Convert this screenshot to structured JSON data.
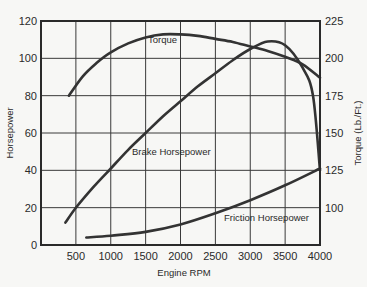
{
  "chart_data": {
    "type": "line",
    "title": "",
    "xlabel": "Engine RPM",
    "ylabel": "Horsepower",
    "y2label": "Torque (Lb./Ft.)",
    "xlim": [
      0,
      4000
    ],
    "ylim": [
      0,
      120
    ],
    "y2lim": [
      75,
      225
    ],
    "grid": true,
    "legend": "inline labels",
    "x_ticks": [
      500,
      1000,
      1500,
      2000,
      2500,
      3000,
      3500,
      4000
    ],
    "y_ticks": [
      0,
      20,
      40,
      60,
      80,
      100,
      120
    ],
    "y2_ticks": [
      100,
      125,
      150,
      175,
      200,
      225
    ],
    "series": [
      {
        "name": "Torque",
        "axis": "right",
        "x": [
          400,
          600,
          800,
          1000,
          1250,
          1500,
          1750,
          2000,
          2250,
          2500,
          2750,
          3000,
          3250,
          3500,
          3750,
          4000
        ],
        "values": [
          175,
          188,
          197,
          204,
          210,
          214,
          216,
          216,
          215,
          213,
          211,
          208,
          205,
          201,
          196,
          187
        ]
      },
      {
        "name": "Brake Horsepower",
        "axis": "left",
        "x": [
          350,
          500,
          750,
          1000,
          1250,
          1500,
          1750,
          2000,
          2250,
          2500,
          2750,
          3000,
          3250,
          3500,
          3750,
          3900,
          4000
        ],
        "values": [
          12,
          20,
          31,
          41,
          51,
          60,
          69,
          77,
          85,
          92,
          99,
          105,
          109,
          107,
          95,
          80,
          40
        ]
      },
      {
        "name": "Friction Horsepower",
        "axis": "left",
        "x": [
          650,
          1000,
          1500,
          2000,
          2500,
          3000,
          3500,
          4000
        ],
        "values": [
          4,
          5,
          7,
          11,
          17,
          24,
          32,
          41
        ]
      }
    ],
    "annotations": [
      "Torque",
      "Brake Horsepower",
      "Friction Horsepower"
    ]
  }
}
